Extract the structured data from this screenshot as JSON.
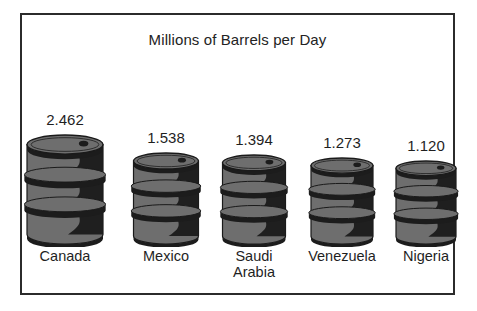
{
  "chart_data": {
    "type": "bar",
    "title": "Millions of Barrels per Day",
    "xlabel": "",
    "ylabel": "Millions of Barrels per Day",
    "categories": [
      "Canada",
      "Mexico",
      "Saudi Arabia",
      "Venezuela",
      "Nigeria"
    ],
    "values": [
      2.462,
      1.538,
      1.394,
      1.273,
      1.12
    ],
    "value_labels": [
      "2.462",
      "1.538",
      "1.394",
      "1.273",
      "1.120"
    ],
    "ylim": [
      0,
      2.462
    ],
    "grid": false,
    "legend": false,
    "note": "Pictograph: each category drawn as an oil barrel scaled to its value",
    "pictogram": "oil-barrel",
    "colors": {
      "background": "#ffffff",
      "frame": "#2b2b2b",
      "barrel_body": "#6e6e6e",
      "barrel_shadow": "#1c1c1c",
      "barrel_outline": "#1a1a1a",
      "text": "#1f1f1f"
    }
  },
  "chart": {
    "title": "Millions of Barrels per Day",
    "bars": [
      {
        "label": "Canada",
        "label_line1": "Canada",
        "label_line2": "",
        "value": "2.462"
      },
      {
        "label": "Mexico",
        "label_line1": "Mexico",
        "label_line2": "",
        "value": "1.538"
      },
      {
        "label": "Saudi Arabia",
        "label_line1": "Saudi",
        "label_line2": "Arabia",
        "value": "1.394"
      },
      {
        "label": "Venezuela",
        "label_line1": "Venezuela",
        "label_line2": "",
        "value": "1.273"
      },
      {
        "label": "Nigeria",
        "label_line1": "Nigeria",
        "label_line2": "",
        "value": "1.120"
      }
    ]
  }
}
